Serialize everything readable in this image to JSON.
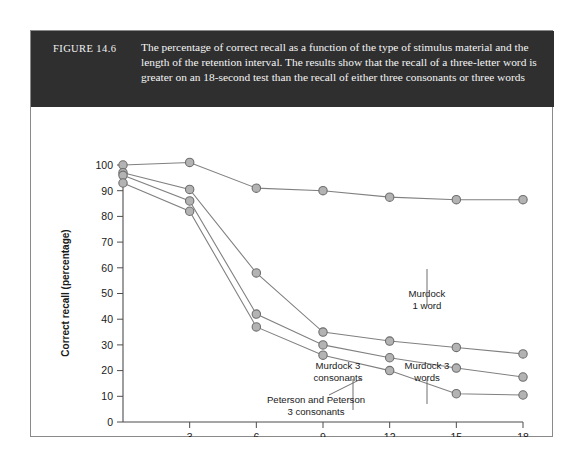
{
  "figure": {
    "number_label": "FIGURE 14.6",
    "caption": "The percentage of correct recall as a function of the type of stimulus material and the length of the retention interval. The results show that the recall of a three-letter word is greater on an 18-second test than the recall of either three consonants or three words",
    "banner_color": "#2f2f30",
    "border_color": "#8a8a8a",
    "marker_fill": "#b3b3b3",
    "marker_stroke": "#6e6e6e",
    "line_color": "#808080"
  },
  "chart_data": {
    "type": "line",
    "title": "",
    "xlabel": "Retention interval (seconds)",
    "ylabel": "Correct recall (percentage)",
    "xlim": [
      0,
      18
    ],
    "ylim": [
      0,
      100
    ],
    "xticks": [
      0,
      3,
      6,
      9,
      12,
      15,
      18
    ],
    "xtick_labels": [
      "0",
      "3",
      "6",
      "9",
      "12",
      "15",
      "18"
    ],
    "yticks": [
      0,
      10,
      20,
      30,
      40,
      50,
      60,
      70,
      80,
      90,
      100
    ],
    "ytick_labels": [
      "0",
      "10",
      "20",
      "30",
      "40",
      "50",
      "60",
      "70",
      "80",
      "90",
      "100"
    ],
    "grid": false,
    "legend": "annotations",
    "series": [
      {
        "name": "Murdock 1 word",
        "x": [
          0,
          3,
          6,
          9,
          12,
          15,
          18
        ],
        "values": [
          100,
          101,
          91,
          90,
          87.5,
          86.5,
          86.5
        ]
      },
      {
        "name": "Murdock 3 words",
        "x": [
          0,
          3,
          6,
          9,
          12,
          15,
          18
        ],
        "values": [
          97,
          90.5,
          58,
          35,
          31.5,
          29,
          26.5
        ]
      },
      {
        "name": "Murdock 3 consonants",
        "x": [
          0,
          3,
          6,
          9,
          12,
          15,
          18
        ],
        "values": [
          96,
          86,
          42,
          30,
          25,
          21,
          17.5
        ]
      },
      {
        "name": "Peterson and Peterson 3 consonants",
        "x": [
          0,
          3,
          6,
          9,
          12,
          15,
          18
        ],
        "values": [
          93,
          82,
          37,
          26,
          20,
          11,
          10.5
        ]
      }
    ],
    "annotations": [
      {
        "text_lines": [
          "Murdock",
          "1 word"
        ],
        "target_series": "Murdock 1 word"
      },
      {
        "text_lines": [
          "Murdock 3",
          "words"
        ],
        "target_series": "Murdock 3 words"
      },
      {
        "text_lines": [
          "Murdock 3",
          "consonants"
        ],
        "target_series": "Murdock 3 consonants"
      },
      {
        "text_lines": [
          "Peterson and Peterson",
          "3 consonants"
        ],
        "target_series": "Peterson and Peterson 3 consonants"
      }
    ]
  }
}
